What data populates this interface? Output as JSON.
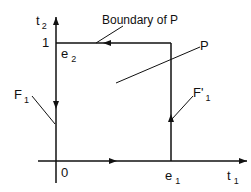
{
  "diagram": {
    "axes": {
      "x_label": "t",
      "x_label_sub": "1",
      "y_label": "t",
      "y_label_sub": "2",
      "origin_label": "0",
      "y_tick_label": "1"
    },
    "vertices": {
      "e1": {
        "main": "e",
        "sub": "1"
      },
      "e2": {
        "main": "e",
        "sub": "2"
      }
    },
    "annotations": {
      "boundary": "Boundary of P",
      "region": "P",
      "left_face": {
        "main": "F",
        "sub": "1"
      },
      "right_face": {
        "main": "F'",
        "sub": "1"
      }
    },
    "colors": {
      "stroke": "#111111",
      "background": "#ffffff"
    }
  }
}
